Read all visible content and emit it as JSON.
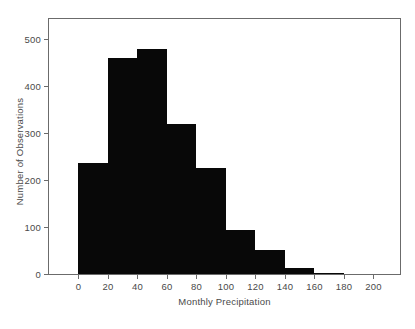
{
  "chart_data": {
    "type": "bar",
    "title": "",
    "subtitle": "",
    "xlabel": "Monthly Precipitation",
    "ylabel": "Number of Observations",
    "bin_width": 20,
    "bin_edges": [
      0,
      20,
      40,
      60,
      80,
      100,
      120,
      140,
      160,
      180,
      200
    ],
    "categories": [
      "0-20",
      "20-40",
      "40-60",
      "60-80",
      "80-100",
      "100-120",
      "120-140",
      "140-160",
      "160-180",
      "180-200"
    ],
    "values": [
      236,
      460,
      479,
      318,
      226,
      93,
      50,
      12,
      2,
      0
    ],
    "series": [
      {
        "name": "Number of Observations",
        "values": [
          236,
          460,
          479,
          318,
          226,
          93,
          50,
          12,
          2,
          0
        ]
      }
    ],
    "xlim": [
      -20,
      218
    ],
    "ylim": [
      0,
      542
    ],
    "xticks": [
      0,
      20,
      40,
      60,
      80,
      100,
      120,
      140,
      160,
      180,
      200
    ],
    "xtick_labels": [
      "0",
      "20",
      "40",
      "60",
      "80",
      "100",
      "120",
      "140",
      "160",
      "180",
      "200"
    ],
    "yticks": [
      0,
      100,
      200,
      300,
      400,
      500
    ],
    "ytick_labels": [
      "0",
      "100",
      "200",
      "300",
      "400",
      "500"
    ],
    "grid": false,
    "legend": null,
    "legend_position": "none",
    "bar_color": "#080808",
    "frame_color": "#6b6b6b",
    "text_color": "#4a4a4a",
    "background": "#ffffff"
  }
}
